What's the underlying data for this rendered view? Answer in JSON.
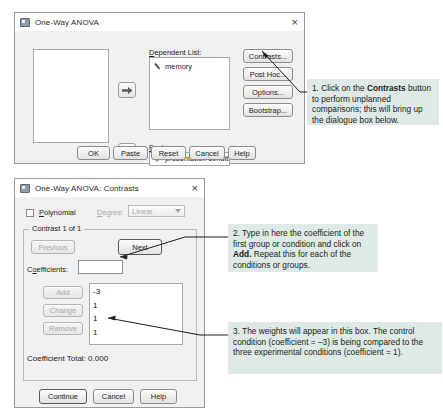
{
  "dialog1": {
    "title": "One-Way ANOVA",
    "close_label": "×",
    "source_list_items": [],
    "dependent_label": "Dependent List:",
    "dependent_items": [
      {
        "icon": "ruler-variable-icon",
        "name": "memory"
      }
    ],
    "factor_label": "Factor:",
    "factor_value": "presentation conditio..",
    "factor_icon": "nominal-variable-icon",
    "side_buttons": [
      "Contrasts...",
      "Post Hoc...",
      "Options...",
      "Bootstrap..."
    ],
    "side_buttons_mnemonic": [
      "n",
      "H",
      "O",
      "B"
    ],
    "bottom_buttons": [
      "OK",
      "Paste",
      "Reset",
      "Cancel",
      "Help"
    ],
    "move_button_icon": "right-arrow-icon"
  },
  "dialog2": {
    "title": "One-Way ANOVA: Contrasts",
    "close_label": "×",
    "polynomial_label": "Polynomial",
    "polynomial_checked": false,
    "degree_label": "Degree:",
    "degree_value": "Linear",
    "degree_enabled": false,
    "contrast_group_title": "Contrast 1 of 1",
    "previous_label": "Previous",
    "previous_enabled": false,
    "next_label": "Next",
    "next_enabled": true,
    "coefficients_label": "Coefficients:",
    "coefficients_value": "",
    "edit_buttons": [
      {
        "label": "Add",
        "enabled": false
      },
      {
        "label": "Change",
        "enabled": false
      },
      {
        "label": "Remove",
        "enabled": false
      }
    ],
    "coefficient_values": [
      "-3",
      "1",
      "1",
      "1"
    ],
    "coefficient_total_label": "Coefficient Total:",
    "coefficient_total_value": "0.000",
    "bottom_buttons": [
      "Continue",
      "Cancel",
      "Help"
    ]
  },
  "annotations": [
    {
      "id": "annotation-1",
      "parts": [
        {
          "text": "1. Click on the ",
          "bold": false
        },
        {
          "text": "Contrasts",
          "bold": true
        },
        {
          "text": " button to perform unplanned comparisons; this will bring up the dialogue box below.",
          "bold": false
        }
      ],
      "plain": "1. Click on the Contrasts button to perform unplanned comparisons; this will bring up the dialogue box below."
    },
    {
      "id": "annotation-2",
      "parts": [
        {
          "text": "2. Type in here the coefficient of the first group or condition and click on ",
          "bold": false
        },
        {
          "text": "Add.",
          "bold": true
        },
        {
          "text": " Repeat this for each of the conditions or groups.",
          "bold": false
        }
      ],
      "plain": "2. Type in here the coefficient of the first group or condition and click on Add. Repeat this for each of the conditions or groups."
    },
    {
      "id": "annotation-3",
      "parts": [
        {
          "text": "3. The weights will appear in this box. The control condition (coefficient = –3) is being compared to the three experimental conditions (coefficient = 1).",
          "bold": false
        }
      ],
      "plain": "3. The weights will appear in this box. The control condition (coefficient = –3) is being compared to the three experimental conditions (coefficient = 1)."
    }
  ],
  "colors": {
    "callout_bg": "#dfeae7",
    "dialog_bg": "#f0f0f0",
    "dialog_border": "#9a9a9a",
    "field_bg": "#ffffff",
    "leader_line": "#1d1d1d"
  }
}
